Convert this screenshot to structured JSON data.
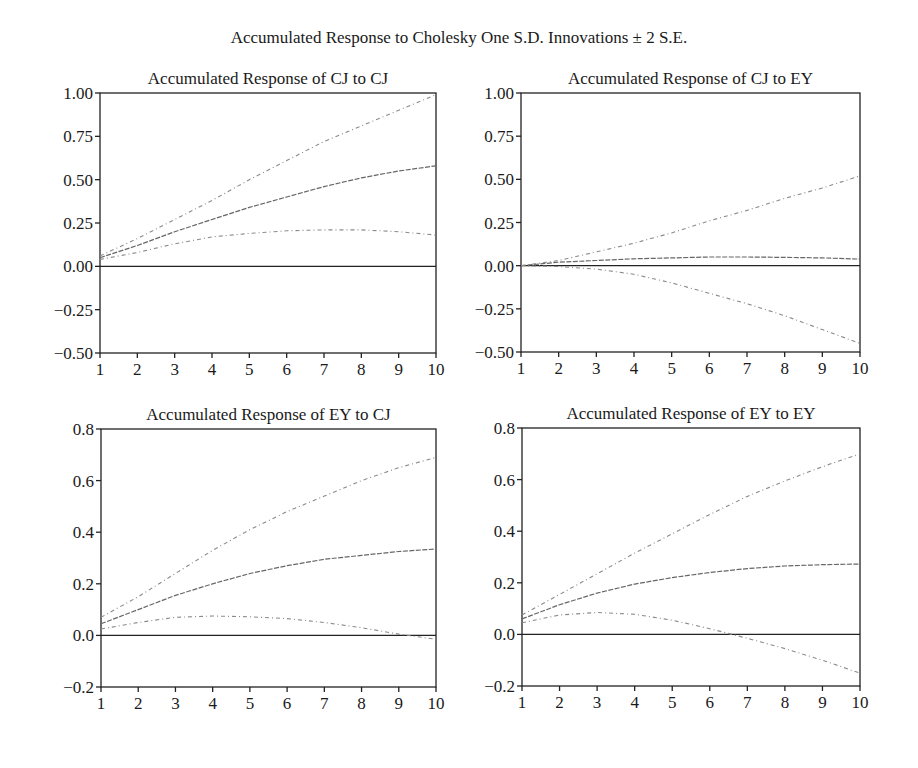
{
  "figure": {
    "title": "Accumulated Response to Cholesky One S.D. Innovations ± 2 S.E."
  },
  "chart_data": [
    {
      "type": "line",
      "title": "Accumulated Response of CJ to CJ",
      "x": [
        1,
        2,
        3,
        4,
        5,
        6,
        7,
        8,
        9,
        10
      ],
      "xticks": [
        "1",
        "2",
        "3",
        "4",
        "5",
        "6",
        "7",
        "8",
        "9",
        "10"
      ],
      "yticks": [
        "1.00",
        "0.75",
        "0.50",
        "0.25",
        "0.00",
        "−0.25",
        "−0.50"
      ],
      "ylim": [
        -0.5,
        1.0
      ],
      "grid": false,
      "series": [
        {
          "name": "Response",
          "values": [
            0.05,
            0.12,
            0.2,
            0.27,
            0.34,
            0.4,
            0.46,
            0.51,
            0.55,
            0.58
          ]
        },
        {
          "name": "+2 S.E.",
          "values": [
            0.06,
            0.16,
            0.27,
            0.38,
            0.5,
            0.61,
            0.72,
            0.81,
            0.9,
            0.99
          ]
        },
        {
          "name": "-2 S.E.",
          "values": [
            0.04,
            0.08,
            0.13,
            0.17,
            0.19,
            0.205,
            0.21,
            0.21,
            0.2,
            0.18
          ]
        }
      ]
    },
    {
      "type": "line",
      "title": "Accumulated Response of CJ to EY",
      "x": [
        1,
        2,
        3,
        4,
        5,
        6,
        7,
        8,
        9,
        10
      ],
      "xticks": [
        "1",
        "2",
        "3",
        "4",
        "5",
        "6",
        "7",
        "8",
        "9",
        "10"
      ],
      "yticks": [
        "1.00",
        "0.75",
        "0.50",
        "0.25",
        "0.00",
        "−0.25",
        "−0.50"
      ],
      "ylim": [
        -0.5,
        1.0
      ],
      "grid": false,
      "series": [
        {
          "name": "Response",
          "values": [
            0.0,
            0.02,
            0.03,
            0.04,
            0.045,
            0.05,
            0.05,
            0.048,
            0.045,
            0.038
          ]
        },
        {
          "name": "+2 S.E.",
          "values": [
            0.0,
            0.03,
            0.08,
            0.13,
            0.19,
            0.26,
            0.32,
            0.39,
            0.45,
            0.52
          ]
        },
        {
          "name": "-2 S.E.",
          "values": [
            0.0,
            -0.005,
            -0.02,
            -0.05,
            -0.1,
            -0.16,
            -0.22,
            -0.29,
            -0.37,
            -0.45
          ]
        }
      ]
    },
    {
      "type": "line",
      "title": "Accumulated Response of EY to CJ",
      "x": [
        1,
        2,
        3,
        4,
        5,
        6,
        7,
        8,
        9,
        10
      ],
      "xticks": [
        "1",
        "2",
        "3",
        "4",
        "5",
        "6",
        "7",
        "8",
        "9",
        "10"
      ],
      "yticks": [
        "0.8",
        "0.6",
        "0.4",
        "0.2",
        "0.0",
        "−0.2"
      ],
      "ylim": [
        -0.2,
        0.8
      ],
      "grid": false,
      "series": [
        {
          "name": "Response",
          "values": [
            0.045,
            0.1,
            0.155,
            0.2,
            0.24,
            0.27,
            0.295,
            0.31,
            0.325,
            0.335
          ]
        },
        {
          "name": "+2 S.E.",
          "values": [
            0.07,
            0.15,
            0.24,
            0.33,
            0.41,
            0.48,
            0.54,
            0.6,
            0.65,
            0.69
          ]
        },
        {
          "name": "-2 S.E.",
          "values": [
            0.025,
            0.05,
            0.07,
            0.075,
            0.072,
            0.065,
            0.05,
            0.03,
            0.005,
            -0.015
          ]
        }
      ]
    },
    {
      "type": "line",
      "title": "Accumulated Response of EY to EY",
      "x": [
        1,
        2,
        3,
        4,
        5,
        6,
        7,
        8,
        9,
        10
      ],
      "xticks": [
        "1",
        "2",
        "3",
        "4",
        "5",
        "6",
        "7",
        "8",
        "9",
        "10"
      ],
      "yticks": [
        "0.8",
        "0.6",
        "0.4",
        "0.2",
        "0.0",
        "−0.2"
      ],
      "ylim": [
        -0.2,
        0.8
      ],
      "grid": false,
      "series": [
        {
          "name": "Response",
          "values": [
            0.06,
            0.115,
            0.16,
            0.195,
            0.22,
            0.24,
            0.255,
            0.265,
            0.27,
            0.273
          ]
        },
        {
          "name": "+2 S.E.",
          "values": [
            0.075,
            0.155,
            0.235,
            0.315,
            0.39,
            0.465,
            0.535,
            0.595,
            0.65,
            0.7
          ]
        },
        {
          "name": "-2 S.E.",
          "values": [
            0.045,
            0.075,
            0.085,
            0.078,
            0.055,
            0.022,
            -0.015,
            -0.055,
            -0.1,
            -0.15
          ]
        }
      ]
    }
  ]
}
